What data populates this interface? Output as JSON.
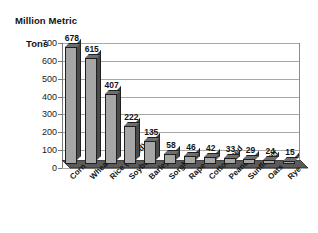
{
  "chart_data": {
    "type": "bar",
    "title": "Million Metric Tons",
    "title_line1": "Million Metric",
    "title_line2": "Tons",
    "xlabel": "",
    "ylabel": "Million Metric Tons",
    "ylim": [
      0,
      700
    ],
    "ytick_step": 100,
    "yticks": [
      700,
      600,
      500,
      400,
      300,
      200,
      100,
      0
    ],
    "grid": true,
    "legend": false,
    "style": "3d-column",
    "data_labels": true,
    "categories": [
      "Corn",
      "Wheat",
      "Rice (milled)",
      "Soybean",
      "Barley",
      "Sorghum",
      "Rape",
      "Cottonseed",
      "Peanut",
      "Sunflower",
      "Oats",
      "Rye"
    ],
    "values": [
      678,
      615,
      407,
      222,
      135,
      58,
      46,
      42,
      33,
      29,
      24,
      15
    ],
    "series": [
      {
        "name": "Production",
        "values": [
          678,
          615,
          407,
          222,
          135,
          58,
          46,
          42,
          33,
          29,
          24,
          15
        ]
      }
    ],
    "colors": {
      "bar_face": "#a6a6a6",
      "bar_side": "#4a4a4a",
      "bar_top": "#6e6e6e",
      "bar_outline": "#1f1f1f",
      "gridline": "#a8a8a8",
      "axis": "#7a7a7a",
      "floor": "#5a5a5a",
      "text": "#141414",
      "background": "#ffffff"
    }
  }
}
